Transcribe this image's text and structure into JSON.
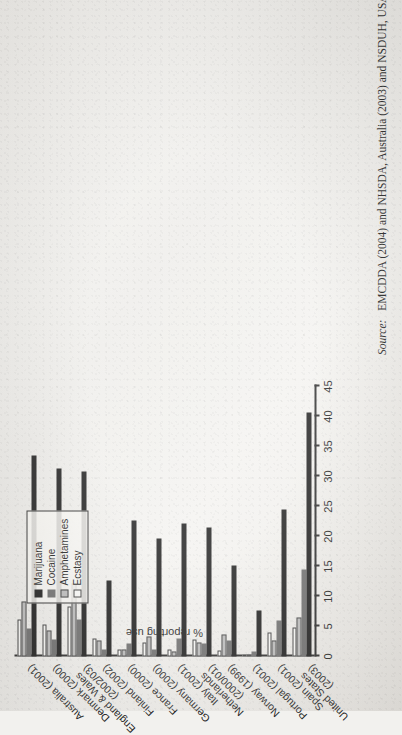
{
  "figure": {
    "orientation": "rotated-90-ccw",
    "legend_title": "",
    "legend_position": "top-left-inside"
  },
  "source": {
    "label": "Source:",
    "text": "EMCDDA (2004) and NHSDA, Australia (2003) and NSDUH, USA (2003)."
  },
  "chart_data": {
    "type": "bar",
    "orientation": "vertical-grouped",
    "title": "",
    "xlabel": "",
    "ylabel": "% reporting use",
    "ylim": [
      0,
      45
    ],
    "yticks": [
      "0",
      "5",
      "10",
      "15",
      "20",
      "25",
      "30",
      "35",
      "40",
      "45"
    ],
    "grid": false,
    "legend": [
      "Marijuana",
      "Cocaine",
      "Amphetamines",
      "Ecstasy"
    ],
    "colors": {
      "Marijuana": "#1d1d1d",
      "Cocaine": "#6e6e6e",
      "Amphetamines": "#bdbdbd",
      "Ecstasy": "#fbfbf9"
    },
    "categories": [
      "Australia (2001)",
      "Denmark (2000)",
      "England & Wales (2002/03)",
      "Finland (2002)",
      "France (2000)",
      "Germany (2000)",
      "Italy (2001)",
      "Netherlands (2000/01)",
      "Norway (1999)",
      "Portugal (2001)",
      "Spain (2001)",
      "United States (2003)"
    ],
    "category_lines": [
      [
        "Australia (2001)"
      ],
      [
        "Denmark (2000)"
      ],
      [
        "England & Wales",
        "(2002/03)"
      ],
      [
        "Finland (2002)"
      ],
      [
        "France (2000)"
      ],
      [
        "Germany (2000)"
      ],
      [
        "Italy (2001)"
      ],
      [
        "Netherlands",
        "(2000/01)"
      ],
      [
        "Norway (1999)"
      ],
      [
        "Portugal (2001)"
      ],
      [
        "Spain (2001)"
      ],
      [
        "United States",
        "(2003)"
      ]
    ],
    "series": [
      {
        "name": "Marijuana",
        "values": [
          33.5,
          31.3,
          30.8,
          12.7,
          22.6,
          19.6,
          22.2,
          21.5,
          15.1,
          7.6,
          24.5,
          40.6
        ]
      },
      {
        "name": "Cocaine",
        "values": [
          4.6,
          2.8,
          6.2,
          1.2,
          2.1,
          1.2,
          3.0,
          2.1,
          2.7,
          0.9,
          6.0,
          14.5
        ]
      },
      {
        "name": "Amphetamines",
        "values": [
          9.1,
          4.4,
          12.2,
          2.6,
          1.1,
          3.3,
          0.8,
          2.3,
          3.6,
          0.3,
          2.7,
          6.5
        ]
      },
      {
        "name": "Ecstasy",
        "values": [
          6.1,
          5.4,
          8.3,
          3.0,
          1.2,
          2.4,
          1.2,
          2.9,
          1.0,
          0.4,
          4.0,
          4.8
        ]
      }
    ]
  }
}
